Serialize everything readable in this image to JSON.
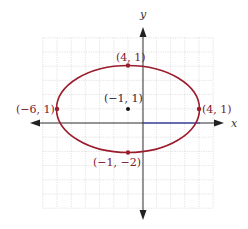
{
  "diagram": {
    "type": "ellipse-on-grid",
    "axes": {
      "x_label": "x",
      "y_label": "y"
    },
    "grid": {
      "x_min": -7,
      "x_max": 5,
      "y_min": -6,
      "y_max": 6,
      "step": 1
    },
    "ellipse": {
      "center": [
        -1,
        1
      ],
      "semi_x": 5,
      "semi_y": 3,
      "color": "#9b1c2c"
    },
    "points": [
      {
        "id": "top",
        "coord": [
          -1,
          4
        ],
        "label": "(4, 1)",
        "color": "#9b1c2c"
      },
      {
        "id": "left",
        "coord": [
          -6,
          1
        ],
        "label": "(−6, 1)",
        "color": "#9b1c2c"
      },
      {
        "id": "right",
        "coord": [
          4,
          1
        ],
        "label": "(4, 1)",
        "color": "#9b1c2c"
      },
      {
        "id": "bottom",
        "coord": [
          -1,
          -2
        ],
        "label": "(−1, −2)",
        "color": "#9b1c2c"
      },
      {
        "id": "center",
        "coord": [
          -1,
          1
        ],
        "label": "(−1, 1)",
        "color": "#111111"
      }
    ],
    "colors": {
      "axis": "#333333",
      "grid": "#cccccc",
      "label_red": "#7a2030",
      "label_dark": "#2a2a40",
      "x_axis_segment": "#3b46c4"
    }
  }
}
